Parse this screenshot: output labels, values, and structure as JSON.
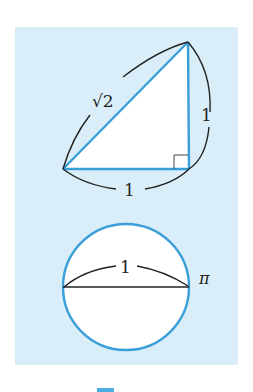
{
  "figure": {
    "colors": {
      "panel_background": "#d9eef8",
      "shape_stroke": "#3a9fd8",
      "annotation_stroke": "#222222",
      "shape_fill": "#ffffff"
    },
    "triangle": {
      "description": "Right isosceles triangle with legs 1 and hypotenuse sqrt(2)",
      "labels": {
        "hypotenuse": "√2",
        "vertical_leg": "1",
        "horizontal_leg": "1"
      }
    },
    "circle": {
      "description": "Circle with diameter 1 and circumference pi",
      "labels": {
        "diameter": "1",
        "circumference": "π"
      }
    }
  }
}
